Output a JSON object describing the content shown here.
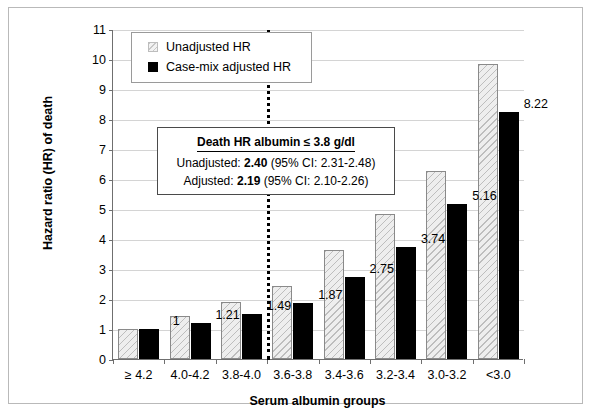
{
  "chart_data": {
    "type": "bar",
    "title": "",
    "xlabel": "Serum albumin groups",
    "ylabel": "Hazard ratio (HR) of death",
    "ylim": [
      0,
      11
    ],
    "yticks": [
      0,
      1,
      2,
      3,
      4,
      5,
      6,
      7,
      8,
      9,
      10,
      11
    ],
    "grid": true,
    "legend_position": "top-left",
    "categories": [
      "≥ 4.2",
      "4.0-4.2",
      "3.8-4.0",
      "3.6-3.8",
      "3.4-3.6",
      "3.2-3.4",
      "3.0-3.2",
      "<3.0"
    ],
    "series": [
      {
        "name": "Unadjusted HR",
        "color": "#eeeeee",
        "values": [
          1.0,
          1.45,
          1.9,
          2.43,
          3.62,
          4.84,
          6.26,
          9.82
        ],
        "labels": [
          "",
          "",
          "",
          "",
          "",
          "",
          "",
          ""
        ]
      },
      {
        "name": "Case-mix adjusted HR",
        "color": "#000000",
        "values": [
          1.0,
          1.21,
          1.49,
          1.87,
          2.75,
          3.74,
          5.16,
          8.22
        ],
        "labels": [
          "1",
          "1.21",
          "1.49",
          "1.87",
          "2.75",
          "3.74",
          "5.16",
          "8.22"
        ]
      }
    ],
    "annotations": [
      {
        "type": "vertical-line",
        "style": "dotted",
        "after_category_index": 2,
        "color": "#000000"
      }
    ]
  },
  "legend": {
    "items": [
      {
        "label": "Unadjusted HR",
        "swatch": "hatched-light-square"
      },
      {
        "label": "Case-mix adjusted HR",
        "swatch": "filled-black-square"
      }
    ]
  },
  "annotation_box": {
    "title": "Death HR albumin ≤ 3.8 g/dl",
    "line1_prefix": "Unadjusted: ",
    "line1_value": "2.40",
    "line1_suffix": " (95% CI: 2.31-2.48)",
    "line2_prefix": "Adjusted: ",
    "line2_value": "2.19",
    "line2_suffix": " (95% CI: 2.10-2.26)"
  }
}
